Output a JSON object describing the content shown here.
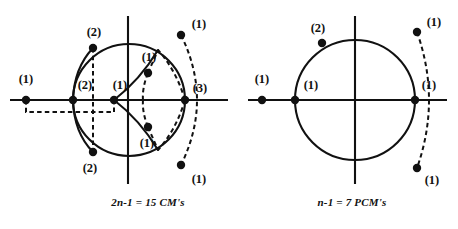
{
  "figure": {
    "background_color": "#ffffff",
    "ink_color": "#111111",
    "panels": [
      {
        "id": "left-panel",
        "caption": "2n-1 = 15 CM's",
        "caption_x": 148,
        "caption_y": 206,
        "circle": {
          "cx": 129,
          "cy": 100,
          "r": 56
        },
        "axes": {
          "horizontal": {
            "x1": 10,
            "y1": 100,
            "x2": 228,
            "y2": 100
          },
          "vertical": {
            "x1": 128,
            "y1": 16,
            "x2": 128,
            "y2": 184
          }
        },
        "dashed_box": {
          "x1": 26,
          "y1": 100,
          "x2": 114,
          "y2": 112
        },
        "solid_arcs": [
          {
            "name": "left-upper-arc",
            "d": "M 73 100 Q 74 68 93 48"
          },
          {
            "name": "left-lower-arc",
            "d": "M 73 100 Q 74 133 93 152"
          },
          {
            "name": "inner-upper-solid-arc",
            "d": "M 114 100 Q 140 120 158 150"
          },
          {
            "name": "inner-lower-solid-arc",
            "d": "M 114 100 Q 140 80 158 50"
          }
        ],
        "dashed_arcs": [
          {
            "name": "outer-right-dashed-arc",
            "d": "M 181 35 Q 213 100 181 165"
          },
          {
            "name": "inner-right-dashed-upper",
            "d": "M 185 100 Q 176 70 158 50"
          },
          {
            "name": "inner-right-dashed-lower",
            "d": "M 185 100 Q 176 130 158 150"
          },
          {
            "name": "small-dashed-upper",
            "d": "M 148 73 Q 142 88 143 100"
          },
          {
            "name": "small-dashed-lower",
            "d": "M 148 127 Q 142 112 143 100"
          },
          {
            "name": "node-link-upper",
            "d": "M 148 73 L 158 50"
          },
          {
            "name": "node-link-lower",
            "d": "M 148 127 L 158 150"
          },
          {
            "name": "vertical-dashed-chord",
            "d": "M 93 48 L 93 152"
          }
        ],
        "points": [
          {
            "name": "outer-left-point",
            "x": 26,
            "y": 100,
            "label": "(1)",
            "lx": 26,
            "ly": 83,
            "anchor": "middle"
          },
          {
            "name": "circle-left-point",
            "x": 73,
            "y": 100,
            "label": "(2)",
            "lx": 85,
            "ly": 89,
            "anchor": "middle"
          },
          {
            "name": "inner-axis-point",
            "x": 114,
            "y": 100,
            "label": "(1)",
            "lx": 120,
            "ly": 89,
            "anchor": "middle"
          },
          {
            "name": "circle-top-left-point",
            "x": 93,
            "y": 48,
            "label": "(2)",
            "lx": 94,
            "ly": 36,
            "anchor": "middle"
          },
          {
            "name": "circle-bottom-left-point",
            "x": 93,
            "y": 152,
            "label": "(2)",
            "lx": 90,
            "ly": 172,
            "anchor": "middle"
          },
          {
            "name": "circle-right-point",
            "x": 185,
            "y": 100,
            "label": "(3)",
            "lx": 200,
            "ly": 92,
            "anchor": "middle"
          },
          {
            "name": "upper-right-outer-point",
            "x": 181,
            "y": 35,
            "label": "(1)",
            "lx": 199,
            "ly": 28,
            "anchor": "middle"
          },
          {
            "name": "lower-right-outer-point",
            "x": 181,
            "y": 165,
            "label": "(1)",
            "lx": 199,
            "ly": 183,
            "anchor": "middle"
          },
          {
            "name": "upper-inner-point",
            "x": 148,
            "y": 73,
            "label": "(1)",
            "lx": 149,
            "ly": 61,
            "anchor": "middle"
          },
          {
            "name": "lower-inner-point",
            "x": 148,
            "y": 127,
            "label": "(1)",
            "lx": 147,
            "ly": 147,
            "anchor": "middle"
          }
        ]
      },
      {
        "id": "right-panel",
        "caption": "n-1 = 7 PCM's",
        "caption_x": 352,
        "caption_y": 206,
        "circle": {
          "cx": 355,
          "cy": 100,
          "r": 60
        },
        "axes": {
          "horizontal": {
            "x1": 248,
            "y1": 100,
            "x2": 447,
            "y2": 100
          },
          "vertical": {
            "x1": 355,
            "y1": 16,
            "x2": 355,
            "y2": 184
          }
        },
        "dashed_box": null,
        "solid_arcs": [],
        "dashed_arcs": [
          {
            "name": "right-outer-dashed-arc",
            "d": "M 417 32 Q 441 100 417 168"
          }
        ],
        "points": [
          {
            "name": "outer-left-point",
            "x": 262,
            "y": 100,
            "label": "(1)",
            "lx": 262,
            "ly": 83,
            "anchor": "middle"
          },
          {
            "name": "circle-left-point",
            "x": 295,
            "y": 100,
            "label": "(1)",
            "lx": 311,
            "ly": 89,
            "anchor": "middle"
          },
          {
            "name": "circle-right-point",
            "x": 415,
            "y": 100,
            "label": "(1)",
            "lx": 429,
            "ly": 89,
            "anchor": "middle"
          },
          {
            "name": "circle-upper-left-point",
            "x": 322,
            "y": 43,
            "label": "(2)",
            "lx": 318,
            "ly": 32,
            "anchor": "middle"
          },
          {
            "name": "upper-right-outer-point",
            "x": 417,
            "y": 32,
            "label": "(1)",
            "lx": 434,
            "ly": 26,
            "anchor": "middle"
          },
          {
            "name": "lower-right-outer-point",
            "x": 417,
            "y": 168,
            "label": "(1)",
            "lx": 432,
            "ly": 184,
            "anchor": "middle"
          }
        ]
      }
    ],
    "dot_radius": 4.2
  }
}
